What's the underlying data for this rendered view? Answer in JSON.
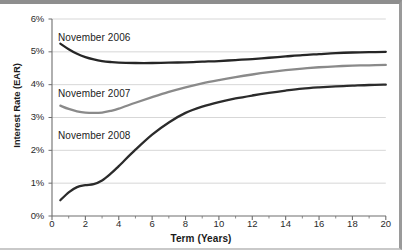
{
  "chart_data": {
    "type": "line",
    "title": "",
    "xlabel": "Term (Years)",
    "ylabel": "Interest Rate (EAR)",
    "xlim": [
      0,
      20
    ],
    "ylim": [
      0,
      6
    ],
    "grid": "horizontal",
    "legend_position": "inline-annotations",
    "xticks": [
      "0",
      "2",
      "4",
      "6",
      "8",
      "10",
      "12",
      "14",
      "16",
      "18",
      "20"
    ],
    "xtick_values": [
      0,
      2,
      4,
      6,
      8,
      10,
      12,
      14,
      16,
      18,
      20
    ],
    "yticks": [
      "0%",
      "1%",
      "2%",
      "3%",
      "4%",
      "5%",
      "6%"
    ],
    "ytick_values": [
      0,
      1,
      2,
      3,
      4,
      5,
      6
    ],
    "x": [
      0.5,
      1,
      1.5,
      2,
      2.5,
      3,
      3.5,
      4,
      5,
      6,
      7,
      8,
      9,
      10,
      11,
      12,
      13,
      14,
      15,
      16,
      17,
      18,
      19,
      20
    ],
    "series": [
      {
        "name": "November 2006",
        "color": "#262626",
        "values": [
          5.25,
          5.08,
          4.94,
          4.84,
          4.77,
          4.72,
          4.69,
          4.67,
          4.66,
          4.66,
          4.67,
          4.68,
          4.7,
          4.72,
          4.75,
          4.78,
          4.82,
          4.86,
          4.9,
          4.93,
          4.96,
          4.98,
          4.99,
          5.0
        ]
      },
      {
        "name": "November 2007",
        "color": "#8a8a8a",
        "values": [
          3.36,
          3.26,
          3.19,
          3.15,
          3.14,
          3.15,
          3.2,
          3.27,
          3.45,
          3.62,
          3.78,
          3.92,
          4.04,
          4.14,
          4.23,
          4.31,
          4.38,
          4.44,
          4.49,
          4.53,
          4.56,
          4.58,
          4.59,
          4.6
        ]
      },
      {
        "name": "November 2008",
        "color": "#2b2b2b",
        "values": [
          0.48,
          0.72,
          0.88,
          0.94,
          0.97,
          1.08,
          1.28,
          1.52,
          2.02,
          2.48,
          2.85,
          3.14,
          3.33,
          3.47,
          3.58,
          3.67,
          3.75,
          3.82,
          3.88,
          3.92,
          3.95,
          3.97,
          3.99,
          4.0
        ]
      }
    ],
    "annotations": [
      {
        "text": "November 2006",
        "x_px": 58,
        "y_px": 28
      },
      {
        "text": "November 2007",
        "x_px": 58,
        "y_px": 84
      },
      {
        "text": "November 2008",
        "x_px": 58,
        "y_px": 126
      }
    ]
  }
}
